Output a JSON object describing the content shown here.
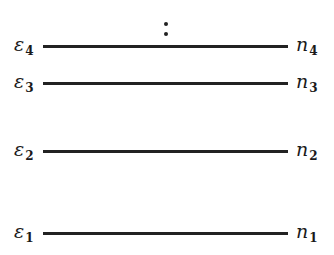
{
  "diagram": {
    "type": "energy-level-diagram",
    "continuation": "vertical-ellipsis",
    "levels": [
      {
        "energy_symbol": "ε",
        "energy_index": "4",
        "occupancy_symbol": "n",
        "occupancy_index": "4",
        "y": 46
      },
      {
        "energy_symbol": "ε",
        "energy_index": "3",
        "occupancy_symbol": "n",
        "occupancy_index": "3",
        "y": 83
      },
      {
        "energy_symbol": "ε",
        "energy_index": "2",
        "occupancy_symbol": "n",
        "occupancy_index": "2",
        "y": 151
      },
      {
        "energy_symbol": "ε",
        "energy_index": "1",
        "occupancy_symbol": "n",
        "occupancy_index": "1",
        "y": 233
      }
    ]
  }
}
